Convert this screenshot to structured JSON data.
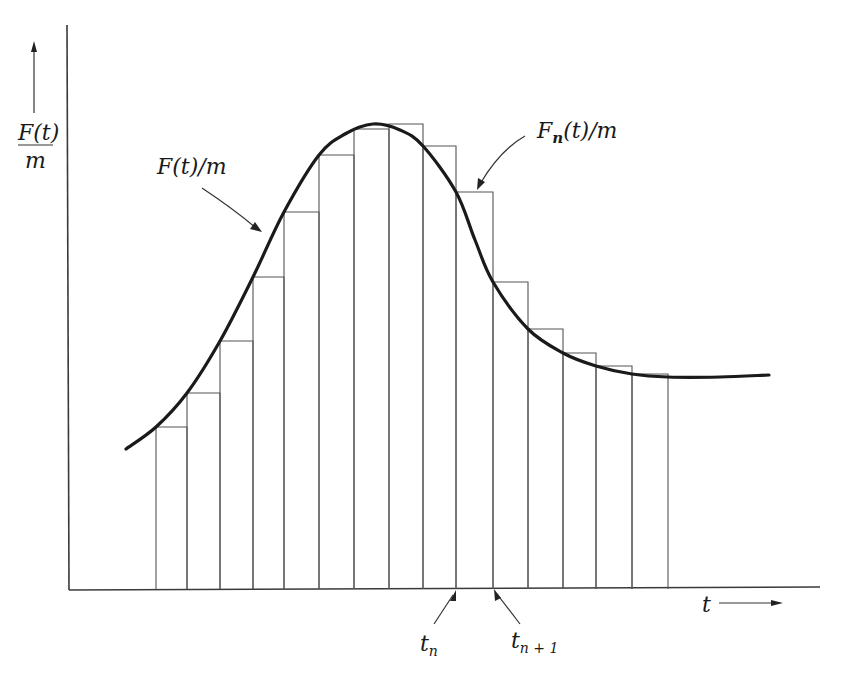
{
  "figure": {
    "y_axis_label": {
      "numerator": "F(t)",
      "denominator": "m"
    },
    "x_axis_label": "t",
    "curve_label": "F(t)/m",
    "step_label": {
      "F": "F",
      "sub": "n",
      "rest": "(t)/m"
    },
    "tick_labels": [
      {
        "base": "t",
        "sub": "n"
      },
      {
        "base": "t",
        "sub": "n + 1"
      }
    ]
  },
  "chart_data": {
    "type": "bar",
    "title": "",
    "xlabel": "t",
    "ylabel": "F(t)/m",
    "grid": false,
    "legend": "none (inline annotations)",
    "annotations": [
      "F(t)/m",
      "F_n(t)/m",
      "t_n",
      "t_(n+1)"
    ],
    "bar_edges_px": [
      156,
      187,
      220,
      253,
      284,
      319,
      354,
      389,
      423,
      456,
      493,
      528,
      563,
      596,
      632,
      668
    ],
    "bar_tops_px": [
      427,
      393,
      341,
      277,
      212,
      155,
      129,
      124,
      146,
      192,
      282,
      329,
      353,
      366,
      374
    ],
    "baseline_px": 589,
    "curve_px": [
      [
        126,
        449
      ],
      [
        156,
        427
      ],
      [
        187,
        393
      ],
      [
        220,
        341
      ],
      [
        253,
        277
      ],
      [
        284,
        212
      ],
      [
        319,
        155
      ],
      [
        345,
        134
      ],
      [
        373,
        124
      ],
      [
        400,
        130
      ],
      [
        423,
        146
      ],
      [
        456,
        192
      ],
      [
        475,
        240
      ],
      [
        493,
        282
      ],
      [
        528,
        329
      ],
      [
        563,
        353
      ],
      [
        596,
        366
      ],
      [
        632,
        374
      ],
      [
        668,
        377
      ],
      [
        720,
        377
      ],
      [
        769,
        375
      ]
    ],
    "tn_index": 9,
    "tn1_index": 10
  }
}
